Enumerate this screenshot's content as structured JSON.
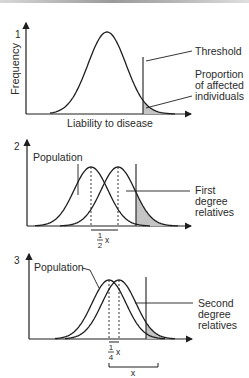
{
  "panels": [
    {
      "number": "1",
      "y_axis_label": "Frequency",
      "x_axis_label": "Liability to disease",
      "curves": [
        {
          "name": "Population",
          "mean": 0
        }
      ],
      "threshold_label": "Threshold",
      "shaded_label_lines": [
        "Proportion",
        "of affected",
        "individuals"
      ]
    },
    {
      "number": "2",
      "population_label": "Population",
      "relatives_label_lines": [
        "First",
        "degree",
        "relatives"
      ],
      "curves": [
        {
          "name": "Population",
          "mean": 0
        },
        {
          "name": "First degree relatives",
          "mean": 0.5
        }
      ],
      "shift_label": {
        "num": "1",
        "den": "2",
        "var": "x"
      }
    },
    {
      "number": "3",
      "population_label": "Population",
      "relatives_label_lines": [
        "Second",
        "degree",
        "relatives"
      ],
      "curves": [
        {
          "name": "Population",
          "mean": 0
        },
        {
          "name": "Second degree relatives",
          "mean": 0.25
        }
      ],
      "shift_label": {
        "num": "1",
        "den": "4",
        "var": "x"
      },
      "full_shift_label": "x"
    }
  ],
  "colors": {
    "line": "#1e1e1e",
    "shade": "#c4c4c4"
  }
}
